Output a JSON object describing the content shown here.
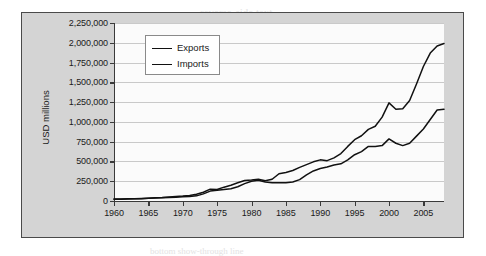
{
  "page_bleed": [
    {
      "text": "reverse-side text",
      "x": 200,
      "y": 6,
      "size": 11
    },
    {
      "text": "faint show-through",
      "x": 212,
      "y": 22,
      "size": 9
    },
    {
      "text": "Trends in International Trade",
      "x": 196,
      "y": 86,
      "size": 10
    },
    {
      "text": "bleed through wording",
      "x": 186,
      "y": 104,
      "size": 9
    },
    {
      "text": "continued paragraph text",
      "x": 180,
      "y": 118,
      "size": 9
    },
    {
      "text": "lower band of text",
      "x": 190,
      "y": 182,
      "size": 9
    },
    {
      "text": "bottom show-through line",
      "x": 150,
      "y": 246,
      "size": 9
    }
  ],
  "chart_data": {
    "type": "line",
    "title": "",
    "xlabel": "",
    "ylabel": "USD millions",
    "xlim": [
      1960,
      2008
    ],
    "ylim": [
      0,
      2250000
    ],
    "grid": true,
    "legend_position": "top-left-inside",
    "ytick_labels": [
      "2,250,000",
      "2,000,000",
      "1,750,000",
      "1,500,000",
      "1,250,000",
      "1,000,000",
      "750,000",
      "500,000",
      "250,000",
      "0"
    ],
    "ytick_values": [
      2250000,
      2000000,
      1750000,
      1500000,
      1250000,
      1000000,
      750000,
      500000,
      250000,
      0
    ],
    "xtick_labels": [
      "1960",
      "1965",
      "1970",
      "1975",
      "1980",
      "1985",
      "1990",
      "1995",
      "2000",
      "2005"
    ],
    "xtick_values": [
      1960,
      1965,
      1970,
      1975,
      1980,
      1985,
      1990,
      1995,
      2000,
      2005
    ],
    "x": [
      1960,
      1961,
      1962,
      1963,
      1964,
      1965,
      1966,
      1967,
      1968,
      1969,
      1970,
      1971,
      1972,
      1973,
      1974,
      1975,
      1976,
      1977,
      1978,
      1979,
      1980,
      1981,
      1982,
      1983,
      1984,
      1985,
      1986,
      1987,
      1988,
      1989,
      1990,
      1991,
      1992,
      1993,
      1994,
      1995,
      1996,
      1997,
      1998,
      1999,
      2000,
      2001,
      2002,
      2003,
      2004,
      2005,
      2006,
      2007,
      2008
    ],
    "series": [
      {
        "name": "Exports",
        "color": "#111111",
        "values": [
          25000,
          26000,
          27000,
          29000,
          33000,
          35000,
          38000,
          40000,
          43000,
          47000,
          55000,
          58000,
          65000,
          90000,
          125000,
          135000,
          145000,
          155000,
          180000,
          220000,
          250000,
          262000,
          240000,
          230000,
          232000,
          230000,
          240000,
          270000,
          330000,
          380000,
          410000,
          430000,
          455000,
          470000,
          520000,
          585000,
          625000,
          690000,
          690000,
          700000,
          785000,
          730000,
          700000,
          730000,
          820000,
          910000,
          1030000,
          1150000,
          1160000
        ]
      },
      {
        "name": "Imports",
        "color": "#111111",
        "values": [
          23000,
          23000,
          25000,
          27000,
          30000,
          34000,
          40000,
          43000,
          52000,
          57000,
          62000,
          70000,
          85000,
          110000,
          150000,
          145000,
          175000,
          200000,
          230000,
          260000,
          265000,
          275000,
          255000,
          275000,
          345000,
          360000,
          385000,
          425000,
          460000,
          495000,
          520000,
          510000,
          545000,
          600000,
          690000,
          775000,
          825000,
          905000,
          945000,
          1060000,
          1240000,
          1160000,
          1165000,
          1270000,
          1480000,
          1700000,
          1870000,
          1960000,
          1990000
        ]
      }
    ]
  }
}
